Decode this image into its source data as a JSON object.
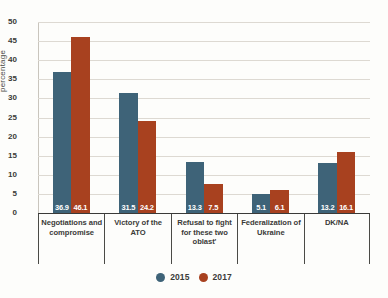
{
  "chart_data": {
    "type": "bar",
    "title": "",
    "xlabel": "",
    "ylabel": "percentage",
    "ylim": [
      0,
      50
    ],
    "yticks": [
      0,
      5,
      10,
      15,
      20,
      25,
      30,
      35,
      40,
      45,
      50
    ],
    "grid": true,
    "legend_position": "bottom-center",
    "categories": [
      "Negotiations and compromise",
      "Victory of the ATO",
      "Refusal to fight for these two oblast'",
      "Federalization of Ukraine",
      "DK/NA"
    ],
    "category_lines": [
      [
        "Negotiations and",
        "compromise"
      ],
      [
        "Victory of the",
        "ATO"
      ],
      [
        "Refusal to fight",
        "for these two",
        "oblast'"
      ],
      [
        "Federalization of",
        "Ukraine"
      ],
      [
        "DK/NA"
      ]
    ],
    "series": [
      {
        "name": "2015",
        "color": "#3e6378",
        "values": [
          36.9,
          31.5,
          13.3,
          5.1,
          13.2
        ],
        "labels": [
          "36.9",
          "31.5",
          "13.3",
          "5.1",
          "13.2"
        ]
      },
      {
        "name": "2017",
        "color": "#a8411f",
        "values": [
          46.1,
          24.2,
          7.5,
          6.1,
          16.1
        ],
        "labels": [
          "46.1",
          "24.2",
          "7.5",
          "6.1",
          "16.1"
        ]
      }
    ]
  },
  "legend": {
    "items": [
      {
        "label": "2015",
        "color": "#3e6378"
      },
      {
        "label": "2017",
        "color": "#a8411f"
      }
    ]
  },
  "axis": {
    "y_title": "percentage",
    "tick_labels": [
      "0",
      "5",
      "10",
      "15",
      "20",
      "25",
      "30",
      "35",
      "40",
      "45",
      "50"
    ]
  },
  "colors": {
    "background": "#fdfdfb",
    "series_2015": "#3e6378",
    "series_2017": "#a8411f",
    "gridline": "#ddd9d2",
    "axis": "#3a3a38",
    "value_text": "#ffffff"
  }
}
